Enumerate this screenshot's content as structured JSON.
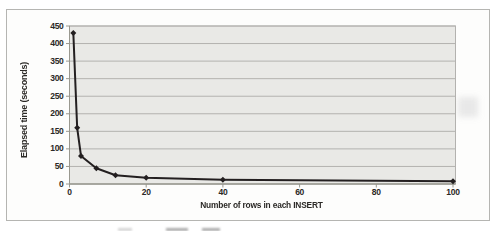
{
  "figure": {
    "kind": "scanned book figure of a line chart",
    "frame_color": "#b5b5b2",
    "text_color": "#2b2926"
  },
  "chart_data": {
    "type": "line",
    "title": "",
    "xlabel": "Number of rows in each INSERT",
    "ylabel": "Elapsed time (seconds)",
    "x": [
      1,
      2,
      3,
      7,
      12,
      20,
      40,
      100
    ],
    "y": [
      430,
      160,
      80,
      45,
      25,
      18,
      12,
      8
    ],
    "xlim": [
      0,
      100
    ],
    "ylim": [
      0,
      450
    ],
    "xticks": [
      0,
      20,
      40,
      60,
      80,
      100
    ],
    "yticks": [
      0,
      50,
      100,
      150,
      200,
      250,
      300,
      350,
      400,
      450
    ],
    "grid": "horizontal gridlines at every 50 on y-axis",
    "legend": "none",
    "marker": "diamond",
    "line_color": "#231f20",
    "plot_bg": "#e9e9e6",
    "grid_color": "#b3b2af",
    "axis_color": "#99988f"
  }
}
